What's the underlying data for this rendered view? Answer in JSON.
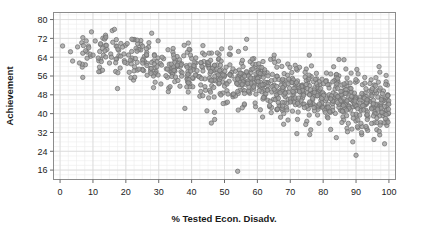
{
  "chart_data": {
    "type": "scatter",
    "title": "",
    "xlabel": "% Tested Econ. Disadv.",
    "ylabel": "Achievement",
    "xlim": [
      -2,
      102
    ],
    "ylim": [
      12,
      83
    ],
    "xticks": [
      0,
      10,
      20,
      30,
      40,
      50,
      60,
      70,
      80,
      90,
      100
    ],
    "yticks": [
      16,
      24,
      32,
      40,
      48,
      56,
      64,
      72,
      80
    ],
    "xtick_labels": [
      "0",
      "10",
      "20",
      "30",
      "40",
      "50",
      "60",
      "70",
      "80",
      "90",
      "100"
    ],
    "ytick_labels": [
      "16",
      "24",
      "32",
      "40",
      "48",
      "56",
      "64",
      "72",
      "80"
    ],
    "grid": true,
    "grid_minor": true,
    "legend": "none",
    "n_points": 960,
    "trend": "negative",
    "series": [
      {
        "name": "Schools",
        "marker": "circle",
        "marker_size": 4.4,
        "fill_color": "#9e9e9e",
        "edge_color": "#6e6e6e",
        "opacity": 0.78,
        "description": "Achievement declines from about 70 at 0% econ. disadvantaged to about 42 at 100%, with spread widening toward the right.",
        "regression": {
          "intercept": 69.5,
          "slope": -0.275
        },
        "scatter_sd": {
          "at_x0": 4.5,
          "at_x100": 6.2
        },
        "notable_outliers": [
          {
            "x": 54,
            "y": 15.5
          },
          {
            "x": 90,
            "y": 22.3
          },
          {
            "x": 46,
            "y": 36.0
          },
          {
            "x": 47,
            "y": 37.5
          },
          {
            "x": 72,
            "y": 31.5
          },
          {
            "x": 84,
            "y": 29.8
          },
          {
            "x": 89,
            "y": 28.0
          },
          {
            "x": 97,
            "y": 60.0
          },
          {
            "x": 39,
            "y": 70.0
          }
        ]
      }
    ]
  },
  "chart_style": {
    "frame_color": "#8c8c8c",
    "grid_major_color": "#d8d8d8",
    "grid_minor_color": "#ececec",
    "background": "#ffffff",
    "tick_color": "#6a6a6a",
    "text_color": "#1a1a1a"
  }
}
